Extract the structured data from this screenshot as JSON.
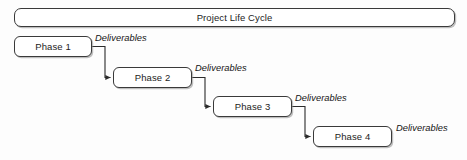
{
  "diagram": {
    "title": "Project Life Cycle",
    "type": "process-flow",
    "banner": {
      "label": "Project Life Cycle",
      "x": 14,
      "y": 8,
      "width": 441,
      "height": 19
    },
    "nodes": [
      {
        "id": "phase-1",
        "label": "Phase 1",
        "x": 14,
        "y": 36,
        "width": 78,
        "height": 21
      },
      {
        "id": "phase-2",
        "label": "Phase 2",
        "x": 113,
        "y": 67,
        "width": 79,
        "height": 21
      },
      {
        "id": "phase-3",
        "label": "Phase 3",
        "x": 213,
        "y": 96,
        "width": 79,
        "height": 21
      },
      {
        "id": "phase-4",
        "label": "Phase 4",
        "x": 313,
        "y": 126,
        "width": 79,
        "height": 21
      }
    ],
    "edge_labels": [
      {
        "id": "deliverables-1",
        "text": "Deliverables",
        "x": 95,
        "y": 33
      },
      {
        "id": "deliverables-2",
        "text": "Deliverables",
        "x": 195,
        "y": 63
      },
      {
        "id": "deliverables-3",
        "text": "Deliverables",
        "x": 295,
        "y": 93
      },
      {
        "id": "deliverables-4",
        "text": "Deliverables",
        "x": 396,
        "y": 123
      }
    ],
    "connectors": [
      {
        "id": "connector-1-to-2",
        "from": "phase-1",
        "to": "phase-2",
        "path": "M 92 46.5 L 105 46.5 L 105 77.5 L 110.5 77.5"
      },
      {
        "id": "connector-2-to-3",
        "from": "phase-2",
        "to": "phase-3",
        "path": "M 192 77.5 L 205 77.5 L 205 106.5 L 210.5 106.5"
      },
      {
        "id": "connector-3-to-4",
        "from": "phase-3",
        "to": "phase-4",
        "path": "M 292 106.5 L 305 106.5 L 305 136.5 L 310.5 136.5"
      }
    ],
    "colors": {
      "background": "#fdfdfd",
      "stroke": "#3a3a3a",
      "connector": "#2b2b2b",
      "text": "#1c1c1c",
      "box_fill": "#ffffff",
      "shadow": "rgba(140,140,140,0.55)"
    }
  }
}
